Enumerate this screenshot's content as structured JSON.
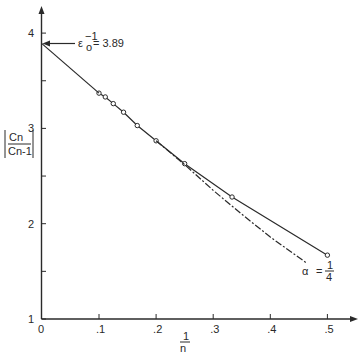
{
  "chart_data": {
    "type": "line",
    "title": "",
    "xlabel": "1/n",
    "ylabel": "|Cn / Cn-1|",
    "xlim": [
      0,
      0.5
    ],
    "ylim": [
      1,
      4
    ],
    "grid": false,
    "x_ticks": [
      "0",
      ".1",
      ".2",
      ".3",
      ".4",
      ".5"
    ],
    "y_ticks": [
      "1",
      "2",
      "3",
      "4"
    ],
    "series": [
      {
        "name": "ratio data",
        "style": "solid with open circles",
        "x": [
          0.1,
          0.111,
          0.125,
          0.143,
          0.167,
          0.2,
          0.25,
          0.333,
          0.5
        ],
        "y": [
          3.37,
          3.33,
          3.26,
          3.17,
          3.03,
          2.87,
          2.63,
          2.28,
          1.67
        ]
      },
      {
        "name": "extrapolation to intercept",
        "style": "solid",
        "x": [
          0,
          0.1
        ],
        "y": [
          3.89,
          3.37
        ]
      },
      {
        "name": "alpha = 1/4 fit",
        "style": "dash-dot",
        "x": [
          0.2,
          0.25,
          0.3,
          0.35,
          0.4,
          0.463
        ],
        "y": [
          2.87,
          2.62,
          2.35,
          2.1,
          1.86,
          1.59
        ]
      }
    ],
    "annotations": [
      {
        "text": "ε₀⁻¹ = 3.89",
        "x": 0,
        "y": 3.89,
        "arrow": true
      },
      {
        "text": "α = 1/4",
        "x": 0.47,
        "y": 1.45
      }
    ]
  },
  "labels": {
    "y_axis_num": "Cn",
    "y_axis_den": "Cn-1",
    "x_axis_num": "1",
    "x_axis_den": "n",
    "eps_base": "ε",
    "eps_sub": "o",
    "eps_sup": "−1",
    "eps_value": "= 3.89",
    "alpha_sym": "α",
    "alpha_eq": "=",
    "alpha_num": "1",
    "alpha_den": "4"
  }
}
